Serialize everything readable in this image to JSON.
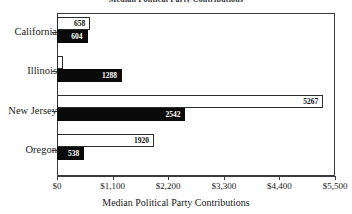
{
  "chart_data": {
    "type": "bar",
    "orientation": "horizontal",
    "title": "Median Political Party Contributions",
    "xlabel": "Median Political Party Contributions",
    "ylabel": "",
    "categories": [
      "California",
      "Illinois",
      "New Jersey",
      "Oregon"
    ],
    "series": [
      {
        "name": "series-1",
        "style": "white-outlined",
        "color": "#ffffff",
        "border_color": "#2b2b2b",
        "values": [
          658,
          120,
          5267,
          1920
        ],
        "labels": [
          "658",
          "",
          "5267",
          "1920"
        ]
      },
      {
        "name": "series-2",
        "style": "black-filled",
        "color": "#0a0a0a",
        "border_color": "#0a0a0a",
        "values": [
          604,
          1288,
          2542,
          538
        ],
        "labels": [
          "604",
          "1288",
          "2542",
          "538"
        ]
      }
    ],
    "xlim": [
      0,
      5500
    ],
    "xticks": [
      0,
      1100,
      2200,
      3300,
      4400,
      5500
    ],
    "xtick_labels": [
      "$0",
      "$1,100",
      "$2,200",
      "$3,300",
      "$4,400",
      "$5,500"
    ],
    "grid": false,
    "legend": "none"
  },
  "axis": {
    "x_title": "Median Political Party Contributions"
  }
}
